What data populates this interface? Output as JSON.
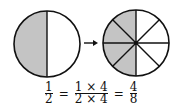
{
  "figure": {
    "left_circle": {
      "parts": 2,
      "shaded": 1,
      "shade_color": "#c4c4c4"
    },
    "right_circle": {
      "parts": 8,
      "shaded": 4,
      "shade_color": "#c4c4c4"
    },
    "arrow": "right-arrow"
  },
  "equation": {
    "f1": {
      "num": "1",
      "den": "2"
    },
    "eq1": "=",
    "f2": {
      "num": "1 × 4",
      "den": "2 × 4"
    },
    "eq2": "=",
    "f3": {
      "num": "4",
      "den": "8"
    }
  }
}
